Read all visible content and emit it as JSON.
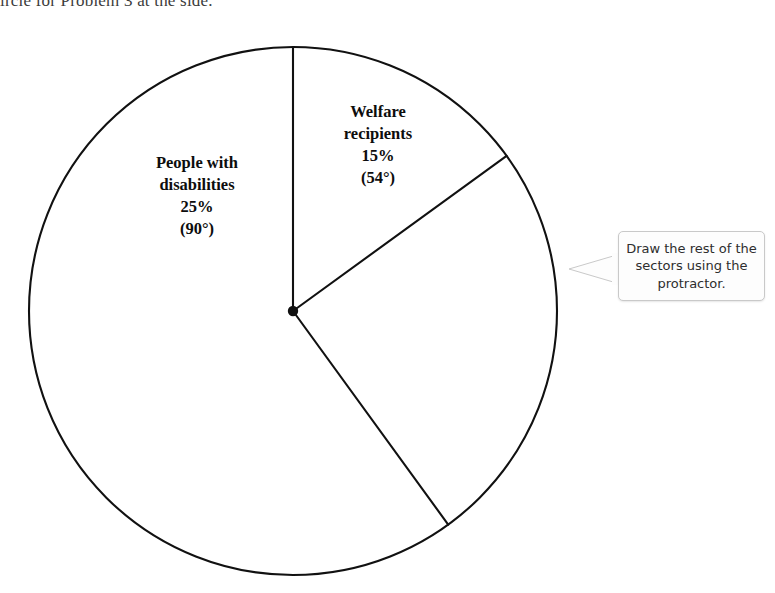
{
  "page": {
    "instruction_line": "ircle for Problem 3 at the side.",
    "background_color": "#ffffff",
    "ink_color": "#111111"
  },
  "callout": {
    "name": "draw-rest-callout",
    "text": "Draw the rest of the sectors using the protractor.",
    "border_color": "#c9c9c9",
    "fill_color": "#fdfdfd",
    "pointer_direction": "left"
  },
  "labels": {
    "disabilities": {
      "line1": "People with",
      "line2": "disabilities",
      "line3": "25%",
      "line4": "(90°)"
    },
    "welfare": {
      "line1": "Welfare",
      "line2": "recipients",
      "line3": "15%",
      "line4": "(54°)"
    }
  },
  "chart_data": {
    "type": "pie",
    "title": "",
    "subtitle": "",
    "xlabel": "",
    "ylabel": "",
    "legend_position": "on-slice",
    "grid": false,
    "units": "percent",
    "total_degrees": 360,
    "center_px": [
      293,
      311
    ],
    "radius_px": 264,
    "start_angle_deg": 90,
    "direction": "clockwise",
    "slices": [
      {
        "label": "Welfare recipients",
        "value": 15,
        "degrees": 54,
        "value_text": "15%",
        "degrees_text": "(54°)",
        "drawn": true,
        "fill": "none",
        "stroke": "#111111"
      },
      {
        "label": "People with disabilities",
        "value": 25,
        "degrees": 90,
        "value_text": "25%",
        "degrees_text": "(90°)",
        "drawn": true,
        "fill": "none",
        "stroke": "#111111"
      },
      {
        "label": "",
        "value": 60,
        "degrees": 216,
        "value_text": "",
        "degrees_text": "",
        "drawn": false,
        "fill": "none",
        "stroke": "#111111"
      }
    ],
    "annotations": [
      {
        "text": "Draw the rest of the sectors using the protractor.",
        "kind": "callout",
        "anchor": "right-edge-of-circle"
      }
    ]
  }
}
